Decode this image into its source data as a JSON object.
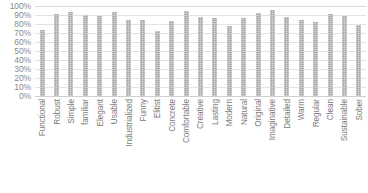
{
  "chart_data": {
    "type": "bar",
    "title": "",
    "subtitle": "",
    "xlabel": "",
    "ylabel": "",
    "ylim": [
      0,
      100
    ],
    "y_unit": "%",
    "grid": true,
    "legend": "none",
    "y_ticks": [
      "100%",
      "90%",
      "80%",
      "70%",
      "60%",
      "50%",
      "40%",
      "30%",
      "20%",
      "10%",
      "0%"
    ],
    "y_tick_values": [
      100,
      90,
      80,
      70,
      60,
      50,
      40,
      30,
      20,
      10,
      0
    ],
    "categories": [
      "Functional",
      "Robust",
      "Simple",
      "familiar",
      "Elegant",
      "Usable",
      "Industrialized",
      "Funny",
      "Elitist",
      "Concrete",
      "Comfortable",
      "Creative",
      "Lasting",
      "Modern",
      "Natural",
      "Original",
      "Imaginative",
      "Detailed",
      "Warm",
      "Regular",
      "Clean",
      "Sustainable",
      "Sober"
    ],
    "values": [
      73,
      91,
      93,
      90,
      89,
      93,
      85,
      85,
      72,
      83,
      95,
      88,
      87,
      78,
      87,
      92,
      96,
      88,
      85,
      82,
      91,
      89,
      79
    ],
    "series": [
      {
        "name": "Percentage",
        "color": "#a8a8a8",
        "values": [
          73,
          91,
          93,
          90,
          89,
          93,
          85,
          85,
          72,
          83,
          95,
          88,
          87,
          78,
          87,
          92,
          96,
          88,
          85,
          82,
          91,
          89,
          79
        ]
      }
    ]
  },
  "style": {
    "bar_color": "#a8a8a8",
    "gridline_color": "#e3e3e3",
    "axis_text_color": "#8c8c8c",
    "background": "#ffffff"
  }
}
